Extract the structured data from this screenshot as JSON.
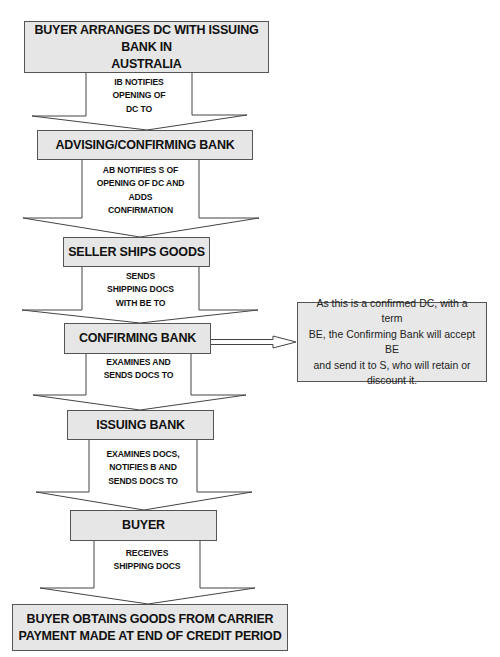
{
  "diagram": {
    "type": "flowchart",
    "direction": "top-to-bottom",
    "colors": {
      "box_fill": "#e6e6e6",
      "box_border": "#555555",
      "arrow_fill": "#ffffff",
      "arrow_stroke": "#444444",
      "text": "#111111"
    },
    "stages": [
      {
        "id": "s1",
        "lines": [
          "BUYER ARRANGES DC WITH ISSUING BANK IN",
          "AUSTRALIA"
        ]
      },
      {
        "id": "s2",
        "lines": [
          "ADVISING/CONFIRMING BANK"
        ]
      },
      {
        "id": "s3",
        "lines": [
          "SELLER SHIPS GOODS"
        ]
      },
      {
        "id": "s4",
        "lines": [
          "CONFIRMING BANK"
        ]
      },
      {
        "id": "s5",
        "lines": [
          "ISSUING BANK"
        ]
      },
      {
        "id": "s6",
        "lines": [
          "BUYER"
        ]
      },
      {
        "id": "s7",
        "lines": [
          "BUYER OBTAINS GOODS FROM CARRIER",
          "PAYMENT MADE AT END OF CREDIT PERIOD"
        ]
      }
    ],
    "arrows": [
      {
        "from": "s1",
        "to": "s2",
        "lines": [
          "IB NOTIFIES",
          "OPENING OF",
          "DC TO"
        ]
      },
      {
        "from": "s2",
        "to": "s3",
        "lines": [
          "AB NOTIFIES S OF",
          "OPENING OF DC AND",
          "ADDS",
          "CONFIRMATION"
        ]
      },
      {
        "from": "s3",
        "to": "s4",
        "lines": [
          "SENDS",
          "SHIPPING DOCS",
          "WITH BE TO"
        ]
      },
      {
        "from": "s4",
        "to": "s5",
        "lines": [
          "EXAMINES AND",
          "SENDS DOCS TO"
        ]
      },
      {
        "from": "s5",
        "to": "s6",
        "lines": [
          "EXAMINES DOCS,",
          "NOTIFIES B AND",
          "SENDS DOCS TO"
        ]
      },
      {
        "from": "s6",
        "to": "s7",
        "lines": [
          "RECEIVES",
          "SHIPPING DOCS"
        ]
      }
    ],
    "side_note": {
      "attached_to": "s4",
      "lines": [
        "As this is a confirmed DC, with a term",
        "BE, the Confirming Bank will accept BE",
        "and send it to S, who will retain or",
        "discount it."
      ]
    }
  }
}
